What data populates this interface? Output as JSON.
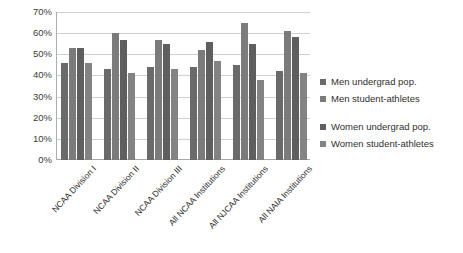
{
  "chart_data": {
    "type": "bar",
    "title": "",
    "subtitle": "",
    "xlabel": "",
    "ylabel": "",
    "ylim": [
      0,
      70
    ],
    "ytick_labels": [
      "70%",
      "60%",
      "50%",
      "40%",
      "30%",
      "20%",
      "10%",
      "0%"
    ],
    "ytick_values": [
      70,
      60,
      50,
      40,
      30,
      20,
      10,
      0
    ],
    "grid": true,
    "legend_position": "right",
    "categories": [
      "NCAA Division I",
      "NCAA Division II",
      "NCAA Division III",
      "All NCAA Institutions",
      "All NJCAA Institutions",
      "All NAIA Institutions"
    ],
    "series": [
      {
        "name": "Men undergrad pop.",
        "color": "#6a6a6a",
        "values": [
          46,
          43,
          44,
          44,
          45,
          42
        ]
      },
      {
        "name": "Men student-athletes",
        "color": "#7b7b7b",
        "values": [
          53,
          60,
          57,
          52,
          65,
          61
        ]
      },
      {
        "name": "Women undergrad pop.",
        "color": "#5f5f5f",
        "values": [
          53,
          57,
          55,
          56,
          55,
          58
        ]
      },
      {
        "name": "Women student-athletes",
        "color": "#838383",
        "values": [
          46,
          41,
          43,
          47,
          38,
          41
        ]
      }
    ]
  },
  "legend": {
    "items": [
      {
        "label": "Men undergrad pop."
      },
      {
        "label": "Men student-athletes"
      },
      {
        "label": "Women undergrad pop."
      },
      {
        "label": "Women student-athletes"
      }
    ]
  }
}
